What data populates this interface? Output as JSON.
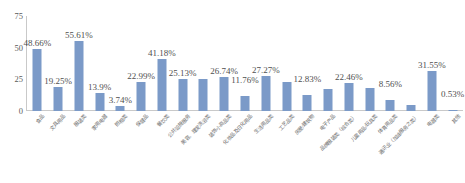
{
  "chart_data": {
    "type": "bar",
    "title": "",
    "subtitle": "",
    "xlabel": "",
    "ylabel": "",
    "ylim": [
      0,
      75
    ],
    "yticks": [
      0,
      25,
      50,
      75
    ],
    "ytick_labels": [
      "0",
      "25",
      "50",
      "75"
    ],
    "grid": false,
    "legend": false,
    "legend_position": "none",
    "value_suffix": "%",
    "bar_color": "#7b9ac8",
    "axis_color": "#c9c9c9",
    "categories": [
      "食品",
      "文具用品",
      "服装类",
      "家用电器",
      "照相类",
      "保健品",
      "餐饮类",
      "公共设施服务",
      "美容、理发洗浴类",
      "装饰小商品类",
      "化妆品及日化用品",
      "生活用品类",
      "工艺品类",
      "房屋/建筑物",
      "电子产品",
      "品牌服装类（综合类）",
      "儿童用品/玩具类",
      "体育用品类",
      "通讯业（加油服务之类）",
      "电器类",
      "其他"
    ],
    "values": [
      48.66,
      19.25,
      55.61,
      13.9,
      3.74,
      22.99,
      41.18,
      25.13,
      25.13,
      26.74,
      11.76,
      27.27,
      23.0,
      12.83,
      17.0,
      22.46,
      18.0,
      8.56,
      5.0,
      31.55,
      0.53
    ],
    "value_labels": [
      "48.66%",
      "19.25%",
      "55.61%",
      "13.9%",
      "3.74%",
      "22.99%",
      "41.18%",
      "25.13%",
      "",
      "26.74%",
      "11.76%",
      "27.27%",
      "",
      "12.83%",
      "",
      "22.46%",
      "",
      "8.56%",
      "",
      "31.55%",
      "0.53%"
    ],
    "label_raised": [
      false,
      false,
      false,
      false,
      false,
      false,
      false,
      false,
      false,
      false,
      true,
      false,
      false,
      true,
      false,
      false,
      false,
      true,
      false,
      false,
      true
    ]
  }
}
